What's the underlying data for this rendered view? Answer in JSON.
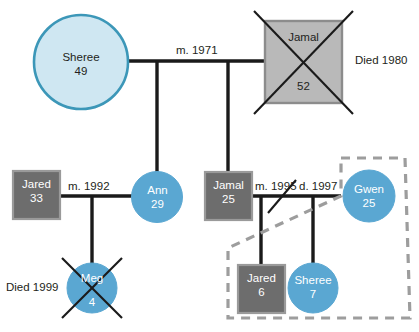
{
  "diagram": {
    "type": "genogram",
    "background": "#ffffff",
    "colors": {
      "female_light_fill": "#cfe7f2",
      "female_light_stroke": "#3c97b8",
      "female_fill": "#5aa7d2",
      "male_light_fill": "#b9b9b9",
      "male_light_stroke": "#8c8c8c",
      "male_fill": "#6d6d6d",
      "male_stroke": "#9a9a9a",
      "line": "#1a1a1a",
      "household_dash": "#9d9d9d",
      "text_dark": "#231f20",
      "text_light": "#ffffff"
    },
    "people": [
      {
        "id": "sheree49",
        "name": "Sheree",
        "age": "49",
        "shape": "circle",
        "gender": "female",
        "deceased": false,
        "generation": 1,
        "style": "light"
      },
      {
        "id": "jamal52",
        "name": "Jamal",
        "age": "52",
        "shape": "square",
        "gender": "male",
        "deceased": true,
        "generation": 1,
        "style": "light"
      },
      {
        "id": "jared33",
        "name": "Jared",
        "age": "33",
        "shape": "square",
        "gender": "male",
        "deceased": false,
        "generation": 2,
        "style": "solid"
      },
      {
        "id": "ann29",
        "name": "Ann",
        "age": "29",
        "shape": "circle",
        "gender": "female",
        "deceased": false,
        "generation": 2,
        "style": "solid"
      },
      {
        "id": "jamal25",
        "name": "Jamal",
        "age": "25",
        "shape": "square",
        "gender": "male",
        "deceased": false,
        "generation": 2,
        "style": "solid"
      },
      {
        "id": "gwen25",
        "name": "Gwen",
        "age": "25",
        "shape": "circle",
        "gender": "female",
        "deceased": false,
        "generation": 2,
        "style": "solid"
      },
      {
        "id": "meg4",
        "name": "Meg",
        "age": "4",
        "shape": "circle",
        "gender": "female",
        "deceased": true,
        "generation": 3,
        "style": "solid"
      },
      {
        "id": "jared6",
        "name": "Jared",
        "age": "6",
        "shape": "square",
        "gender": "male",
        "deceased": false,
        "generation": 3,
        "style": "solid"
      },
      {
        "id": "sheree7",
        "name": "Sheree",
        "age": "7",
        "shape": "circle",
        "gender": "female",
        "deceased": false,
        "generation": 3,
        "style": "solid"
      }
    ],
    "unions": [
      {
        "id": "union1",
        "partners": [
          "sheree49",
          "jamal52"
        ],
        "married_label": "m. 1971",
        "divorced_label": null,
        "children": [
          "ann29",
          "jamal25"
        ]
      },
      {
        "id": "union2",
        "partners": [
          "jared33",
          "ann29"
        ],
        "married_label": "m. 1992",
        "divorced_label": null,
        "children": [
          "meg4"
        ]
      },
      {
        "id": "union3",
        "partners": [
          "jamal25",
          "gwen25"
        ],
        "married_label": "m. 1995",
        "divorced_label": "d. 1997",
        "children": [
          "jared6",
          "sheree7"
        ]
      }
    ],
    "annotations": [
      {
        "id": "died1980",
        "text": "Died 1980",
        "refers_to": "jamal52"
      },
      {
        "id": "died1999",
        "text": "Died 1999",
        "refers_to": "meg4"
      }
    ],
    "household": {
      "id": "household-gwen",
      "style": "dashed-outline",
      "members": [
        "gwen25",
        "jared6",
        "sheree7"
      ]
    },
    "labels": {
      "sheree49_name": "Sheree",
      "sheree49_age": "49",
      "jamal52_name": "Jamal",
      "jamal52_age": "52",
      "jared33_name": "Jared",
      "jared33_age": "33",
      "ann29_name": "Ann",
      "ann29_age": "29",
      "jamal25_name": "Jamal",
      "jamal25_age": "25",
      "gwen25_name": "Gwen",
      "gwen25_age": "25",
      "meg4_name": "Meg",
      "meg4_age": "4",
      "jared6_name": "Jared",
      "jared6_age": "6",
      "sheree7_name": "Sheree",
      "sheree7_age": "7",
      "union1_married": "m. 1971",
      "union2_married": "m. 1992",
      "union3_married": "m. 1995",
      "union3_divorced": "d. 1997",
      "died_1980": "Died 1980",
      "died_1999": "Died 1999"
    }
  }
}
